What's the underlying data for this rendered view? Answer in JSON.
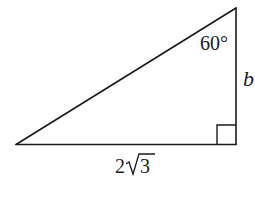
{
  "figure": {
    "type": "right-triangle",
    "stroke_color": "#1a1a1a",
    "vertices": {
      "left": [
        16,
        144.5
      ],
      "right_angle": [
        236,
        144.5
      ],
      "top": [
        236,
        8
      ]
    },
    "angle_label": "60°",
    "vertical_side_label": "b",
    "base_label_coefficient": "2",
    "base_label_radicand": "3",
    "base_label": "2√3",
    "right_angle_marker": true
  }
}
